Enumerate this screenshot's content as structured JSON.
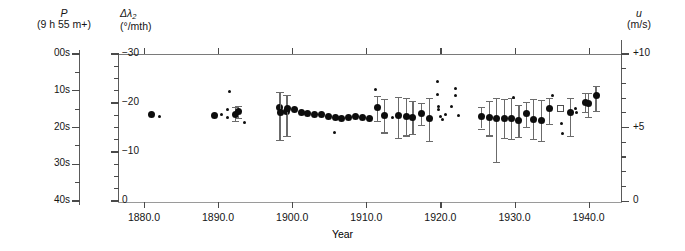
{
  "figure": {
    "left_axis_primary": {
      "symbol": "P",
      "units": "(9 h 55 m+)"
    },
    "left_axis_secondary": {
      "symbol": "Δλ",
      "subscript": "2",
      "units": "(°/mth)"
    },
    "right_axis": {
      "symbol": "u",
      "units": "(m/s)"
    },
    "x_axis_title": "Year"
  },
  "chart_data": {
    "type": "scatter",
    "title": "",
    "xlabel": "Year",
    "ylabel": "Δλ2 (°/mth)",
    "y2label": "u (m/s)",
    "grid": false,
    "legend": "none",
    "xlim": [
      1876.5,
      1944.5
    ],
    "ylim": [
      -30,
      0
    ],
    "y_right_lim": [
      -1.0,
      10.0
    ],
    "x_ticks": [
      1880.0,
      1890.0,
      1900.0,
      1910.0,
      1920.0,
      1930.0,
      1940.0
    ],
    "x_tick_labels": [
      "1880.0",
      "1890.0",
      "1900.0",
      "1910.0",
      "1920.0",
      "1930.0",
      "1940.0"
    ],
    "y_left_ticks_P": [
      0,
      10,
      20,
      30,
      40
    ],
    "y_left_tick_labels_P": [
      "00s",
      "10s",
      "20s",
      "30s",
      "40s"
    ],
    "y_left_ticks_lambda": [
      -30,
      -20,
      -10,
      0
    ],
    "y_left_tick_labels_lambda": [
      "−30",
      "−20",
      "−10",
      "0"
    ],
    "y_right_ticks": [
      0,
      5,
      10
    ],
    "y_right_tick_labels": [
      "0",
      "+5",
      "+10"
    ],
    "series": [
      {
        "name": "annual mean with error bars",
        "marker": "filled-circle",
        "points": [
          {
            "x": 1881.0,
            "y": -17.8
          },
          {
            "x": 1889.5,
            "y": -17.6
          },
          {
            "x": 1892.4,
            "y": -17.9,
            "yerr_low": -16.5,
            "yerr_high": -19.4
          },
          {
            "x": 1892.8,
            "y": -18.4,
            "yerr_low": -17.2,
            "yerr_high": -19.6
          },
          {
            "x": 1898.3,
            "y": -19.3,
            "yerr_low": -12.6,
            "yerr_high": -22.4
          },
          {
            "x": 1898.4,
            "y": -18.2,
            "yerr_low": -12.6,
            "yerr_high": -22.4
          },
          {
            "x": 1899.3,
            "y": -18.5,
            "yerr_low": -13.4,
            "yerr_high": -21.9
          },
          {
            "x": 1899.4,
            "y": -19.1,
            "yerr_low": -13.4,
            "yerr_high": -21.9
          },
          {
            "x": 1900.3,
            "y": -18.9
          },
          {
            "x": 1901.2,
            "y": -18.3
          },
          {
            "x": 1902.1,
            "y": -18.1
          },
          {
            "x": 1903.0,
            "y": -17.9
          },
          {
            "x": 1903.9,
            "y": -17.8
          },
          {
            "x": 1904.9,
            "y": -17.5
          },
          {
            "x": 1905.8,
            "y": -17.3
          },
          {
            "x": 1906.7,
            "y": -17.0
          },
          {
            "x": 1907.6,
            "y": -17.2
          },
          {
            "x": 1908.5,
            "y": -17.4
          },
          {
            "x": 1909.5,
            "y": -17.3
          },
          {
            "x": 1910.4,
            "y": -17.1
          },
          {
            "x": 1911.5,
            "y": -19.3,
            "yerr_low": -16.6,
            "yerr_high": -21.6
          },
          {
            "x": 1912.5,
            "y": -17.6,
            "yerr_low": -14.2,
            "yerr_high": -21.0
          },
          {
            "x": 1914.4,
            "y": -17.7,
            "yerr_low": -13.1,
            "yerr_high": -21.4
          },
          {
            "x": 1915.4,
            "y": -17.5,
            "yerr_low": -13.6,
            "yerr_high": -21.3
          },
          {
            "x": 1916.3,
            "y": -17.2,
            "yerr_low": -13.9,
            "yerr_high": -20.7
          },
          {
            "x": 1917.5,
            "y": -18.0,
            "yerr_low": -15.8,
            "yerr_high": -20.2
          },
          {
            "x": 1918.5,
            "y": -17.1,
            "yerr_low": -12.5,
            "yerr_high": -21.2
          },
          {
            "x": 1925.6,
            "y": -17.5,
            "yerr_low": -15.0,
            "yerr_high": -19.4
          },
          {
            "x": 1926.6,
            "y": -17.2,
            "yerr_low": -13.6,
            "yerr_high": -20.6
          },
          {
            "x": 1927.6,
            "y": -17.1,
            "yerr_low": -8.2,
            "yerr_high": -21.3
          },
          {
            "x": 1928.6,
            "y": -17.1,
            "yerr_low": -13.0,
            "yerr_high": -21.1
          },
          {
            "x": 1929.6,
            "y": -17.1,
            "yerr_low": -12.9,
            "yerr_high": -21.3
          },
          {
            "x": 1930.6,
            "y": -16.6,
            "yerr_low": -13.2,
            "yerr_high": -19.8
          },
          {
            "x": 1931.6,
            "y": -18.1,
            "yerr_low": -15.4,
            "yerr_high": -20.5
          },
          {
            "x": 1932.6,
            "y": -16.9,
            "yerr_low": -12.8,
            "yerr_high": -21.0
          },
          {
            "x": 1933.6,
            "y": -16.7,
            "yerr_low": -12.4,
            "yerr_high": -20.8
          },
          {
            "x": 1934.7,
            "y": -19.0,
            "yerr_low": -16.0,
            "yerr_high": -21.2
          },
          {
            "x": 1937.6,
            "y": -18.2,
            "yerr_low": -13.4,
            "yerr_high": -21.3
          },
          {
            "x": 1939.6,
            "y": -20.4,
            "yerr_low": -18.4,
            "yerr_high": -22.3
          },
          {
            "x": 1941.0,
            "y": -21.7,
            "yerr_low": -18.5,
            "yerr_high": -23.7
          },
          {
            "x": 1940.0,
            "y": -20.1,
            "yerr_low": -17.4,
            "yerr_high": -22.2
          }
        ]
      },
      {
        "name": "individual determinations",
        "marker": "small-dot",
        "points": [
          {
            "x": 1882.1,
            "y": -17.4
          },
          {
            "x": 1890.4,
            "y": -17.8
          },
          {
            "x": 1891.5,
            "y": -22.6
          },
          {
            "x": 1891.3,
            "y": -18.9
          },
          {
            "x": 1891.3,
            "y": -17.2
          },
          {
            "x": 1893.5,
            "y": -16.2
          },
          {
            "x": 1905.7,
            "y": -14.2
          },
          {
            "x": 1911.2,
            "y": -22.9
          },
          {
            "x": 1913.6,
            "y": -17.3
          },
          {
            "x": 1919.6,
            "y": -24.5
          },
          {
            "x": 1919.6,
            "y": -21.9
          },
          {
            "x": 1919.7,
            "y": -19.5
          },
          {
            "x": 1919.8,
            "y": -18.8
          },
          {
            "x": 1920.7,
            "y": -17.9
          },
          {
            "x": 1920.0,
            "y": -17.4
          },
          {
            "x": 1920.3,
            "y": -16.9
          },
          {
            "x": 1921.5,
            "y": -19.4
          },
          {
            "x": 1922.0,
            "y": -23.2
          },
          {
            "x": 1922.0,
            "y": -21.8
          },
          {
            "x": 1922.4,
            "y": -17.7
          },
          {
            "x": 1929.8,
            "y": -21.4
          },
          {
            "x": 1935.1,
            "y": -21.8
          },
          {
            "x": 1936.4,
            "y": -16.0
          },
          {
            "x": 1936.5,
            "y": -14.0
          },
          {
            "x": 1938.2,
            "y": -19.1
          },
          {
            "x": 1938.4,
            "y": -18.3
          },
          {
            "x": 1936.0,
            "y": -18.6
          }
        ]
      },
      {
        "name": "open-symbol determination",
        "marker": "open-square",
        "points": [
          {
            "x": 1936.0,
            "y": -19.2
          }
        ]
      }
    ]
  }
}
